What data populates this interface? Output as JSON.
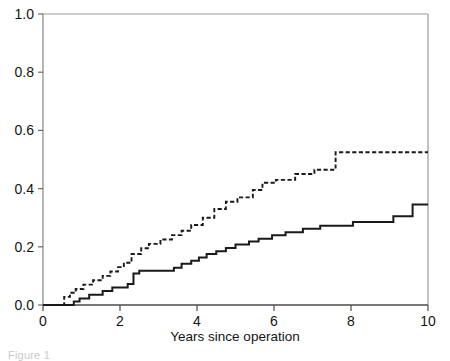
{
  "figure": {
    "caption_fragment": "Figure 1",
    "background_color": "#ffffff",
    "axis_color": "#9a9a9a",
    "curve_color": "#1a1a1a"
  },
  "chart_data": {
    "type": "line",
    "subtype": "step",
    "title": "",
    "xlabel": "Years since operation",
    "ylabel": "",
    "xlim": [
      0,
      10
    ],
    "ylim": [
      0,
      1
    ],
    "xticks": [
      0,
      2,
      4,
      6,
      8,
      10
    ],
    "xtick_labels": [
      "0",
      "2",
      "4",
      "6",
      "8",
      "10"
    ],
    "yticks": [
      0.0,
      0.2,
      0.4,
      0.6,
      0.8,
      1.0
    ],
    "ytick_labels": [
      "0.0",
      "0.2",
      "0.4",
      "0.6",
      "0.8",
      "1.0"
    ],
    "grid": false,
    "legend": false,
    "legend_position": "none",
    "series": [
      {
        "name": "dashed-curve",
        "style": "dashed",
        "color": "#1a1a1a",
        "final_value": 0.525,
        "x": [
          0.0,
          0.55,
          0.55,
          0.7,
          0.7,
          0.85,
          0.85,
          1.05,
          1.05,
          1.3,
          1.3,
          1.55,
          1.55,
          1.75,
          1.75,
          1.95,
          1.95,
          2.1,
          2.1,
          2.3,
          2.3,
          2.55,
          2.55,
          2.75,
          2.75,
          3.05,
          3.05,
          3.35,
          3.35,
          3.6,
          3.6,
          3.85,
          3.85,
          4.15,
          4.15,
          4.45,
          4.45,
          4.75,
          4.75,
          5.05,
          5.05,
          5.45,
          5.45,
          5.7,
          5.7,
          6.05,
          6.05,
          6.55,
          6.55,
          7.05,
          7.05,
          7.6,
          7.6,
          10.0
        ],
        "y": [
          0.0,
          0.0,
          0.028,
          0.028,
          0.042,
          0.042,
          0.055,
          0.055,
          0.07,
          0.07,
          0.085,
          0.085,
          0.1,
          0.1,
          0.115,
          0.115,
          0.13,
          0.13,
          0.145,
          0.145,
          0.175,
          0.175,
          0.195,
          0.195,
          0.21,
          0.21,
          0.225,
          0.225,
          0.24,
          0.24,
          0.255,
          0.255,
          0.275,
          0.275,
          0.3,
          0.3,
          0.33,
          0.33,
          0.355,
          0.355,
          0.37,
          0.37,
          0.395,
          0.395,
          0.42,
          0.42,
          0.43,
          0.43,
          0.45,
          0.45,
          0.465,
          0.465,
          0.525,
          0.525
        ]
      },
      {
        "name": "solid-curve",
        "style": "solid",
        "color": "#1a1a1a",
        "final_value": 0.345,
        "x": [
          0.0,
          0.8,
          0.8,
          0.95,
          0.95,
          1.2,
          1.2,
          1.55,
          1.55,
          1.8,
          1.8,
          2.2,
          2.2,
          2.35,
          2.35,
          2.5,
          2.5,
          3.4,
          3.4,
          3.6,
          3.6,
          3.85,
          3.85,
          4.05,
          4.05,
          4.25,
          4.25,
          4.5,
          4.5,
          4.75,
          4.75,
          5.0,
          5.0,
          5.35,
          5.35,
          5.6,
          5.6,
          5.95,
          5.95,
          6.3,
          6.3,
          6.75,
          6.75,
          7.2,
          7.2,
          8.05,
          8.05,
          9.1,
          9.1,
          9.6,
          9.6,
          10.0
        ],
        "y": [
          0.0,
          0.0,
          0.012,
          0.012,
          0.022,
          0.022,
          0.035,
          0.035,
          0.048,
          0.048,
          0.06,
          0.06,
          0.072,
          0.072,
          0.108,
          0.108,
          0.118,
          0.118,
          0.128,
          0.128,
          0.142,
          0.142,
          0.152,
          0.152,
          0.163,
          0.163,
          0.175,
          0.175,
          0.185,
          0.185,
          0.196,
          0.196,
          0.208,
          0.208,
          0.218,
          0.218,
          0.228,
          0.228,
          0.24,
          0.24,
          0.25,
          0.25,
          0.262,
          0.262,
          0.272,
          0.272,
          0.285,
          0.285,
          0.305,
          0.305,
          0.345,
          0.345
        ]
      }
    ]
  }
}
